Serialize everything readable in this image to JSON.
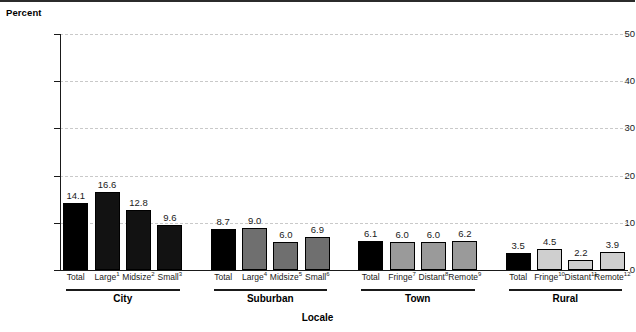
{
  "chart_data": {
    "type": "bar",
    "title": "",
    "xlabel": "Locale",
    "ylabel": "Percent",
    "ylim": [
      0,
      50
    ],
    "yticks": [
      0,
      10,
      20,
      30,
      40,
      50
    ],
    "ytick_labels": [
      "0",
      "10",
      "20",
      "30",
      "40",
      "50"
    ],
    "grid": "horizontal-dashed",
    "legend": "none",
    "groups": [
      {
        "name": "City",
        "shade_class": "shade-city",
        "color": "#121212",
        "categories": [
          {
            "label": "Total",
            "sup": "",
            "value": 14.1,
            "value_text": "14.1",
            "total": true
          },
          {
            "label": "Large",
            "sup": "1",
            "value": 16.6,
            "value_text": "16.6",
            "total": false
          },
          {
            "label": "Midsize",
            "sup": "2",
            "value": 12.8,
            "value_text": "12.8",
            "total": false
          },
          {
            "label": "Small",
            "sup": "3",
            "value": 9.6,
            "value_text": "9.6",
            "total": false
          }
        ]
      },
      {
        "name": "Suburban",
        "shade_class": "shade-suburban",
        "color": "#6f6f6f",
        "categories": [
          {
            "label": "Total",
            "sup": "",
            "value": 8.7,
            "value_text": "8.7",
            "total": true
          },
          {
            "label": "Large",
            "sup": "4",
            "value": 9.0,
            "value_text": "9.0",
            "total": false
          },
          {
            "label": "Midsize",
            "sup": "5",
            "value": 6.0,
            "value_text": "6.0",
            "total": false
          },
          {
            "label": "Small",
            "sup": "6",
            "value": 6.9,
            "value_text": "6.9",
            "total": false
          }
        ]
      },
      {
        "name": "Town",
        "shade_class": "shade-town",
        "color": "#9a9a9a",
        "categories": [
          {
            "label": "Total",
            "sup": "",
            "value": 6.1,
            "value_text": "6.1",
            "total": true
          },
          {
            "label": "Fringe",
            "sup": "7",
            "value": 6.0,
            "value_text": "6.0",
            "total": false
          },
          {
            "label": "Distant",
            "sup": "8",
            "value": 6.0,
            "value_text": "6.0",
            "total": false
          },
          {
            "label": "Remote",
            "sup": "9",
            "value": 6.2,
            "value_text": "6.2",
            "total": false
          }
        ]
      },
      {
        "name": "Rural",
        "shade_class": "shade-rural",
        "color": "#cfcfcf",
        "categories": [
          {
            "label": "Total",
            "sup": "",
            "value": 3.5,
            "value_text": "3.5",
            "total": true
          },
          {
            "label": "Fringe",
            "sup": "10",
            "value": 4.5,
            "value_text": "4.5",
            "total": false
          },
          {
            "label": "Distant",
            "sup": "11",
            "value": 2.2,
            "value_text": "2.2",
            "total": false
          },
          {
            "label": "Remote",
            "sup": "12",
            "value": 3.9,
            "value_text": "3.9",
            "total": false
          }
        ]
      }
    ]
  }
}
